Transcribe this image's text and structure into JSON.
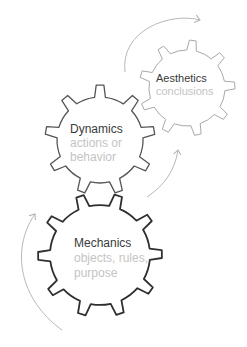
{
  "gears": [
    {
      "name": "Aesthetics",
      "description": "conclusions",
      "stroke": "#a8a8a8"
    },
    {
      "name": "Dynamics",
      "description_lines": [
        "actions or",
        "behavior"
      ],
      "stroke": "#555555"
    },
    {
      "name": "Mechanics",
      "description_lines": [
        "objects, rules,",
        "purpose"
      ],
      "stroke": "#2f2f2f"
    }
  ],
  "colors": {
    "title": "#3a3a3a",
    "subtitle": "#c4c4c4",
    "arrow": "#b0b0b0"
  }
}
